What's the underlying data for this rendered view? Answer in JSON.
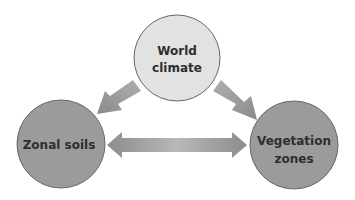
{
  "diagram": {
    "type": "cycle-relationship",
    "colors": {
      "background": "#ffffff",
      "top_node_fill": "#e2e2e2",
      "bottom_node_fill": "#9b9b9b",
      "node_stroke": "#666666",
      "arrow_dark": "#8c8c8c",
      "arrow_light": "#b8b8b8",
      "text": "#2e2e2e"
    },
    "nodes": [
      {
        "id": "world-climate",
        "lines": [
          "World",
          "climate"
        ],
        "cx": 177,
        "cy": 58,
        "r": 43
      },
      {
        "id": "zonal-soils",
        "lines": [
          "Zonal soils"
        ],
        "cx": 61,
        "cy": 144,
        "r": 44
      },
      {
        "id": "vegetation-zones",
        "lines": [
          "Vegetation",
          "zones"
        ],
        "cx": 294,
        "cy": 145,
        "r": 44
      }
    ],
    "edges": [
      {
        "from": "world-climate",
        "to": "zonal-soils",
        "direction": "one-way"
      },
      {
        "from": "world-climate",
        "to": "vegetation-zones",
        "direction": "one-way"
      },
      {
        "from": "zonal-soils",
        "to": "vegetation-zones",
        "direction": "two-way"
      }
    ]
  }
}
